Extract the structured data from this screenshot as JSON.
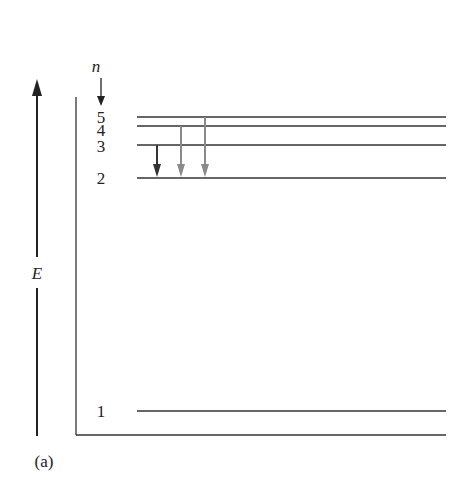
{
  "diagram": {
    "type": "energy-level-diagram",
    "axis_label": "E",
    "quantum_number_label": "n",
    "panel_label": "(a)",
    "levels": [
      {
        "n": "1",
        "y": 411
      },
      {
        "n": "2",
        "y": 178
      },
      {
        "n": "3",
        "y": 145
      },
      {
        "n": "4",
        "y": 126
      },
      {
        "n": "5",
        "y": 117
      }
    ],
    "transitions": [
      {
        "from": "3",
        "to": "2",
        "color": "#333333"
      },
      {
        "from": "4",
        "to": "2",
        "color": "#8a8a8a"
      },
      {
        "from": "5",
        "to": "2",
        "color": "#8a8a8a"
      }
    ]
  }
}
